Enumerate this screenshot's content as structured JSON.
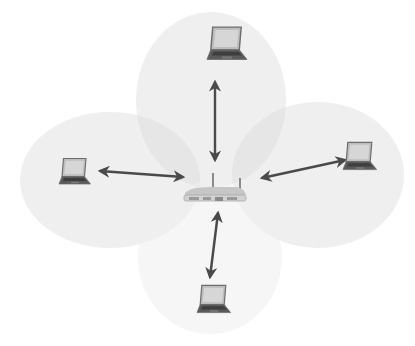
{
  "diagram": {
    "type": "wireless-network-topology",
    "background": "#ffffff",
    "colors": {
      "coverage_fill": "#d9d9d9",
      "coverage_opacity": 0.42,
      "arrow": "#4a4a4a",
      "laptop_frame": "#6e6e6e",
      "laptop_screen": "#bdbdbd",
      "laptop_keyboard": "#5a5a5a",
      "router_body": "#d2d2d2",
      "router_dark": "#8a8a8a"
    },
    "hub": {
      "id": "router",
      "label": "",
      "x": 215,
      "y": 193
    },
    "nodes": [
      {
        "id": "laptop-top",
        "label": "",
        "x": 226,
        "y": 48
      },
      {
        "id": "laptop-left",
        "label": "",
        "x": 76,
        "y": 174
      },
      {
        "id": "laptop-right",
        "label": "",
        "x": 359,
        "y": 161
      },
      {
        "id": "laptop-bottom",
        "label": "",
        "x": 213,
        "y": 302
      }
    ],
    "coverage_areas": [
      {
        "id": "coverage-top",
        "cx": 211,
        "cy": 100,
        "rx": 75,
        "ry": 88
      },
      {
        "id": "coverage-left",
        "cx": 110,
        "cy": 180,
        "rx": 90,
        "ry": 68
      },
      {
        "id": "coverage-right",
        "cx": 318,
        "cy": 175,
        "rx": 86,
        "ry": 73
      },
      {
        "id": "coverage-bottom",
        "cx": 210,
        "cy": 258,
        "rx": 72,
        "ry": 76
      }
    ],
    "links": [
      {
        "from": "router",
        "to": "laptop-top",
        "bidirectional": true
      },
      {
        "from": "router",
        "to": "laptop-left",
        "bidirectional": true
      },
      {
        "from": "router",
        "to": "laptop-right",
        "bidirectional": true
      },
      {
        "from": "router",
        "to": "laptop-bottom",
        "bidirectional": true
      }
    ]
  }
}
